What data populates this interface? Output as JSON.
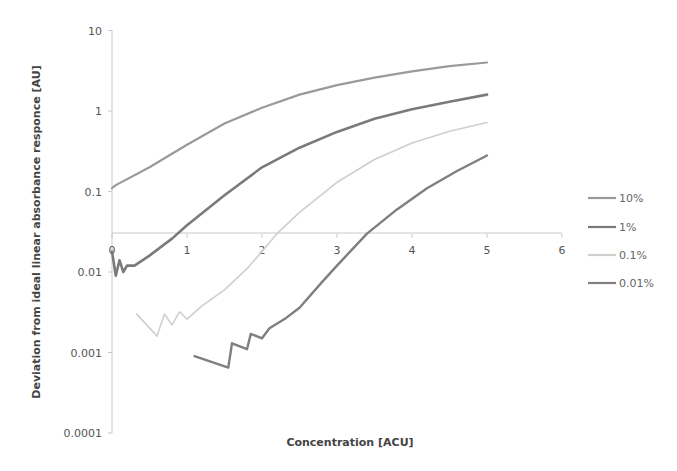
{
  "chart_data": {
    "type": "line",
    "title": "",
    "xlabel": "Concentration [ACU]",
    "ylabel": "Deviation from ideal linear absorbance responce [AU]",
    "x_ticks": [
      "0",
      "1",
      "2",
      "3",
      "4",
      "5",
      "6"
    ],
    "y_ticks": [
      "10",
      "1",
      "0.1",
      "0.01",
      "0.001",
      "0.0001"
    ],
    "xlim": [
      0,
      6
    ],
    "ylim": [
      0.0001,
      10
    ],
    "y_scale": "log",
    "x_axis_crosses_y_at": 0.03,
    "grid": false,
    "legend_position": "right",
    "series": [
      {
        "name": "10%",
        "color": "#9a9a9a",
        "width": 2.2,
        "x": [
          0,
          0.05,
          0.5,
          1,
          1.5,
          2,
          2.5,
          3,
          3.5,
          4,
          4.5,
          5
        ],
        "y": [
          0.11,
          0.12,
          0.2,
          0.38,
          0.7,
          1.1,
          1.6,
          2.1,
          2.6,
          3.1,
          3.6,
          4.0
        ]
      },
      {
        "name": "1%",
        "color": "#7a7a7a",
        "width": 2.6,
        "x": [
          0,
          0.05,
          0.1,
          0.15,
          0.2,
          0.3,
          0.5,
          0.8,
          1,
          1.5,
          2,
          2.5,
          3,
          3.5,
          4,
          4.5,
          5
        ],
        "y": [
          0.018,
          0.009,
          0.014,
          0.01,
          0.012,
          0.012,
          0.016,
          0.026,
          0.038,
          0.09,
          0.2,
          0.35,
          0.55,
          0.8,
          1.05,
          1.3,
          1.6
        ]
      },
      {
        "name": "0.1%",
        "color": "#cfcfcf",
        "width": 1.6,
        "x": [
          0.33,
          0.6,
          0.7,
          0.8,
          0.9,
          1.0,
          1.2,
          1.5,
          1.8,
          2.0,
          2.2,
          2.5,
          3,
          3.5,
          4,
          4.5,
          5
        ],
        "y": [
          0.003,
          0.0016,
          0.003,
          0.0022,
          0.0032,
          0.0026,
          0.0038,
          0.006,
          0.011,
          0.018,
          0.03,
          0.055,
          0.13,
          0.25,
          0.4,
          0.56,
          0.72
        ]
      },
      {
        "name": "0.01%",
        "color": "#7f7f7f",
        "width": 2.4,
        "x": [
          1.1,
          1.55,
          1.6,
          1.8,
          1.85,
          2.0,
          2.1,
          2.3,
          2.5,
          2.8,
          3.0,
          3.4,
          3.8,
          4.2,
          4.6,
          5
        ],
        "y": [
          0.0009,
          0.00065,
          0.0013,
          0.0011,
          0.0017,
          0.0015,
          0.002,
          0.0026,
          0.0036,
          0.0075,
          0.012,
          0.03,
          0.06,
          0.11,
          0.18,
          0.28
        ]
      }
    ]
  },
  "legend": {
    "items": [
      {
        "label": "10%",
        "color": "#9a9a9a"
      },
      {
        "label": "1%",
        "color": "#7a7a7a"
      },
      {
        "label": "0.1%",
        "color": "#cfcfcf"
      },
      {
        "label": "0.01%",
        "color": "#7f7f7f"
      }
    ]
  }
}
